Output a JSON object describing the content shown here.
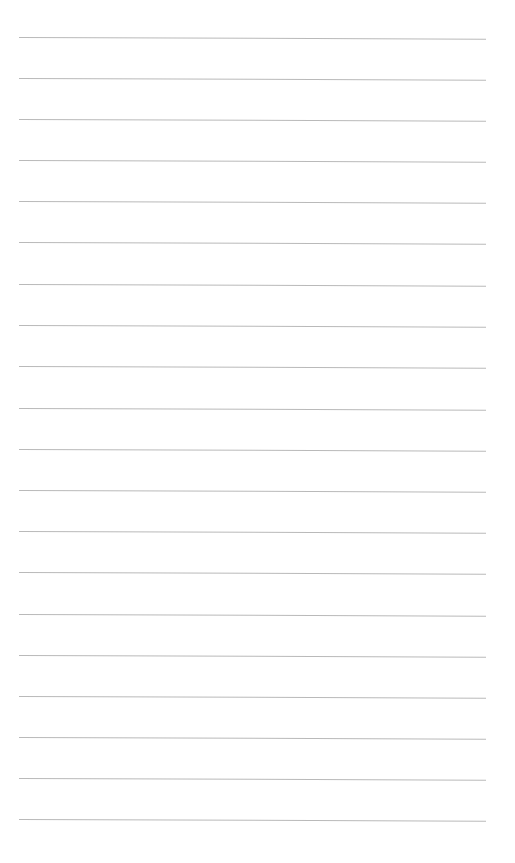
{
  "page": {
    "type": "lined-paper",
    "background_color": "#ffffff",
    "line_color": "#b9b9b9",
    "line_count": 20,
    "lines_y": [
      37,
      78,
      119,
      160,
      201,
      242,
      284,
      325,
      366,
      408,
      449,
      490,
      531,
      572,
      614,
      655,
      696,
      737,
      778,
      819
    ],
    "line_x_start": 19,
    "line_x_end": 486
  }
}
